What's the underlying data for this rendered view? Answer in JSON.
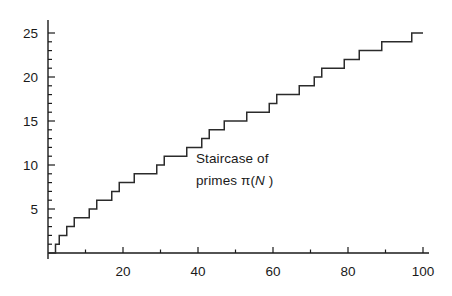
{
  "chart_data": {
    "type": "line",
    "subtype": "step-post",
    "title": "",
    "annotation_line1": "Staircase of",
    "annotation_line2_prefix": "primes ",
    "annotation_line2_pi": "π(",
    "annotation_line2_var": "N",
    "annotation_line2_suffix": " )",
    "xlabel": "",
    "ylabel": "",
    "xlim": [
      0,
      100
    ],
    "ylim": [
      0,
      26
    ],
    "grid": false,
    "legend": null,
    "line_color": "#2b2b2b",
    "axis_color": "#1a1a1a",
    "background": "#ffffff",
    "x_major_ticks": [
      20,
      40,
      60,
      80,
      100
    ],
    "x_major_tick_labels": [
      "20",
      "40",
      "60",
      "80",
      "100"
    ],
    "x_minor_tick_step": 10,
    "y_major_ticks": [
      5,
      10,
      15,
      20,
      25
    ],
    "y_major_tick_labels": [
      "5",
      "10",
      "15",
      "20",
      "25"
    ],
    "y_minor_tick_step": 1,
    "series_name": "pi(N)",
    "primes": [
      2,
      3,
      5,
      7,
      11,
      13,
      17,
      19,
      23,
      29,
      31,
      37,
      41,
      43,
      47,
      53,
      59,
      61,
      67,
      71,
      73,
      79,
      83,
      89,
      97
    ],
    "x": [
      0,
      2,
      3,
      5,
      7,
      11,
      13,
      17,
      19,
      23,
      29,
      31,
      37,
      41,
      43,
      47,
      53,
      59,
      61,
      67,
      71,
      73,
      79,
      83,
      89,
      97,
      100
    ],
    "values": [
      0,
      1,
      2,
      3,
      4,
      5,
      6,
      7,
      8,
      9,
      10,
      11,
      12,
      13,
      14,
      15,
      16,
      17,
      18,
      19,
      20,
      21,
      22,
      23,
      24,
      25,
      25
    ]
  }
}
